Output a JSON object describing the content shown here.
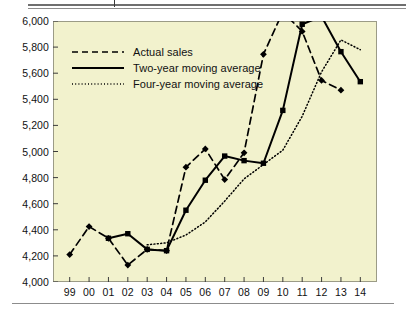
{
  "chart_data": {
    "type": "line",
    "title": "",
    "xlabel": "",
    "ylabel": "",
    "categories": [
      "99",
      "00",
      "01",
      "02",
      "03",
      "04",
      "05",
      "06",
      "07",
      "08",
      "09",
      "10",
      "11",
      "12",
      "13",
      "14"
    ],
    "ylim": [
      4000,
      6000
    ],
    "yticks": [
      4000,
      4200,
      4400,
      4600,
      4800,
      5000,
      5200,
      5400,
      5600,
      5800,
      6000
    ],
    "ytick_labels": [
      "4,000",
      "4,200",
      "4,400",
      "4,600",
      "4,800",
      "5,000",
      "5,200",
      "5,400",
      "5,600",
      "5,800",
      "6,000"
    ],
    "grid": false,
    "legend_position": "top-left",
    "background_color": "#f2f2cd",
    "line_color": "#000000",
    "series": [
      {
        "name": "Actual sales",
        "style": "dashed",
        "marker": "diamond",
        "x": [
          "99",
          "00",
          "01",
          "02",
          "03",
          "04",
          "05",
          "06",
          "07",
          "08",
          "09",
          "10",
          "11",
          "12",
          "13"
        ],
        "values": [
          4210,
          4425,
          4335,
          4130,
          4250,
          4240,
          4880,
          5020,
          4785,
          4990,
          5745,
          6070,
          5920,
          5545,
          5470
        ]
      },
      {
        "name": "Two-year moving average",
        "style": "solid",
        "marker": "square",
        "x": [
          "01",
          "02",
          "03",
          "04",
          "05",
          "06",
          "07",
          "08",
          "09",
          "10",
          "11",
          "12",
          "13",
          "14"
        ],
        "values": [
          4335,
          4370,
          4250,
          4240,
          4550,
          4780,
          4965,
          4930,
          4910,
          5315,
          5975,
          6035,
          5765,
          5535
        ]
      },
      {
        "name": "Four-year moving average",
        "style": "dotted",
        "marker": "none",
        "x": [
          "03",
          "04",
          "05",
          "06",
          "07",
          "08",
          "09",
          "10",
          "11",
          "12",
          "13",
          "14"
        ],
        "values": [
          4285,
          4300,
          4360,
          4460,
          4620,
          4790,
          4900,
          5010,
          5270,
          5610,
          5855,
          5780
        ]
      }
    ]
  },
  "legend": {
    "items": [
      {
        "label": "Actual sales",
        "style": "dashed"
      },
      {
        "label": "Two-year moving average",
        "style": "solid"
      },
      {
        "label": "Four-year moving average",
        "style": "dotted"
      }
    ]
  }
}
